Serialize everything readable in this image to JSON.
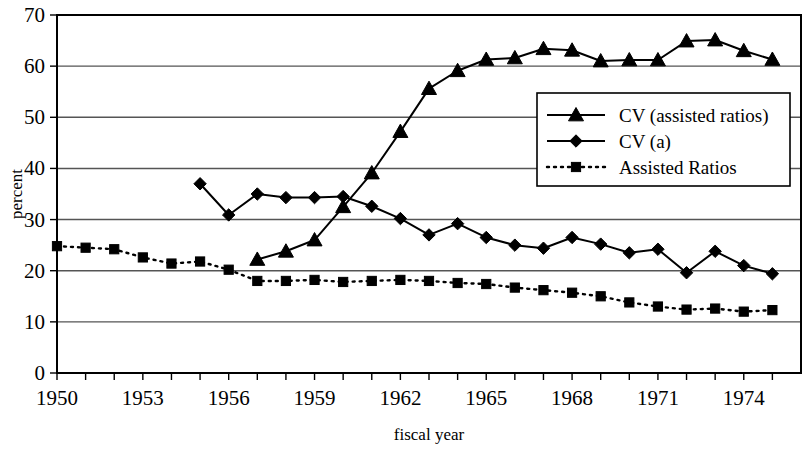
{
  "chart_data": {
    "type": "line",
    "title": "",
    "xlabel": "fiscal year",
    "ylabel": "percent",
    "xlim": [
      1950,
      1976
    ],
    "ylim": [
      0,
      70
    ],
    "ytick_values": [
      0,
      10,
      20,
      30,
      40,
      50,
      60,
      70
    ],
    "ytick_labels": [
      "0",
      "10",
      "20",
      "30",
      "40",
      "50",
      "60",
      "70"
    ],
    "xtick_values": [
      1950,
      1951,
      1952,
      1953,
      1954,
      1955,
      1956,
      1957,
      1958,
      1959,
      1960,
      1961,
      1962,
      1963,
      1964,
      1965,
      1966,
      1967,
      1968,
      1969,
      1970,
      1971,
      1972,
      1973,
      1974,
      1975
    ],
    "xtick_labels_shown": [
      "1950",
      "1953",
      "1956",
      "1959",
      "1962",
      "1965",
      "1968",
      "1971",
      "1974"
    ],
    "grid": "horizontal",
    "legend_position": "center-right",
    "series": [
      {
        "name": "CV (assisted ratios)",
        "marker": "triangle",
        "line_style": "solid",
        "color": "#000000",
        "x": [
          1957,
          1958,
          1959,
          1960,
          1961,
          1962,
          1963,
          1964,
          1965,
          1966,
          1967,
          1968,
          1969,
          1970,
          1971,
          1972,
          1973,
          1974,
          1975
        ],
        "values": [
          22.2,
          23.8,
          26.0,
          32.5,
          39.1,
          47.2,
          55.6,
          59.1,
          61.3,
          61.6,
          63.4,
          63.1,
          61.0,
          61.2,
          61.2,
          64.9,
          65.1,
          63.0,
          61.3
        ]
      },
      {
        "name": "CV (a)",
        "marker": "diamond",
        "line_style": "solid",
        "color": "#000000",
        "x": [
          1955,
          1956,
          1957,
          1958,
          1959,
          1960,
          1961,
          1962,
          1963,
          1964,
          1965,
          1966,
          1967,
          1968,
          1969,
          1970,
          1971,
          1972,
          1973,
          1974,
          1975
        ],
        "values": [
          37.0,
          30.9,
          35.0,
          34.3,
          34.3,
          34.5,
          32.6,
          30.2,
          27.0,
          29.2,
          26.5,
          25.0,
          24.4,
          26.5,
          25.2,
          23.5,
          24.2,
          19.6,
          23.8,
          21.0,
          19.4
        ]
      },
      {
        "name": "Assisted Ratios",
        "marker": "square",
        "line_style": "dotted",
        "color": "#000000",
        "x": [
          1950,
          1951,
          1952,
          1953,
          1954,
          1955,
          1956,
          1957,
          1958,
          1959,
          1960,
          1961,
          1962,
          1963,
          1964,
          1965,
          1966,
          1967,
          1968,
          1969,
          1970,
          1971,
          1972,
          1973,
          1974,
          1975
        ],
        "values": [
          24.8,
          24.5,
          24.2,
          22.6,
          21.4,
          21.8,
          20.2,
          18.0,
          18.0,
          18.2,
          17.8,
          18.0,
          18.2,
          18.0,
          17.6,
          17.4,
          16.7,
          16.2,
          15.7,
          15.0,
          13.8,
          13.0,
          12.4,
          12.6,
          12.0,
          12.3
        ]
      }
    ]
  },
  "legend": {
    "entries": [
      {
        "label": "CV (assisted ratios)"
      },
      {
        "label": "CV (a)"
      },
      {
        "label": "Assisted Ratios"
      }
    ]
  }
}
